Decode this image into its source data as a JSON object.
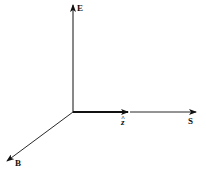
{
  "diagram": {
    "origin": [
      73,
      112
    ],
    "vectors": [
      {
        "name": "E",
        "label": "E",
        "from": [
          73,
          112
        ],
        "to": [
          73,
          4
        ],
        "label_pos": [
          77,
          11
        ]
      },
      {
        "name": "z-hat",
        "label": "z",
        "hat": "^",
        "from": [
          73,
          112
        ],
        "to": [
          128,
          112
        ],
        "label_pos": [
          121,
          124
        ],
        "thick": true
      },
      {
        "name": "S",
        "label": "S",
        "from": [
          128,
          112
        ],
        "to": [
          196,
          112
        ],
        "label_pos": [
          188,
          124
        ]
      },
      {
        "name": "B",
        "label": "B",
        "from": [
          73,
          112
        ],
        "to": [
          7,
          161
        ],
        "label_pos": [
          15,
          165
        ]
      }
    ],
    "colors": {
      "line": "#111111",
      "background": "#ffffff"
    }
  }
}
